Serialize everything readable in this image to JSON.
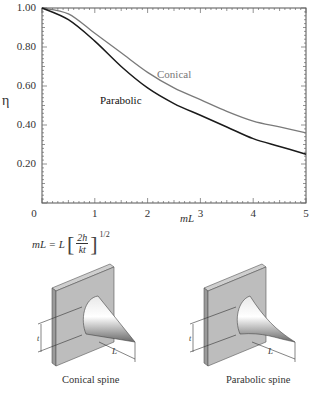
{
  "chart_data": {
    "type": "line",
    "title": "",
    "xlabel": "mL",
    "ylabel": "η",
    "xlim": [
      0,
      5
    ],
    "ylim": [
      0,
      1.0
    ],
    "x_ticks": [
      "0",
      "1",
      "2",
      "3",
      "4",
      "5"
    ],
    "y_ticks": [
      "1.00",
      "0.80",
      "0.60",
      "0.40",
      "0.20"
    ],
    "grid": false,
    "legend": "inline labels",
    "x": [
      0,
      0.5,
      1,
      1.5,
      2,
      2.5,
      3,
      3.5,
      4,
      4.5,
      5
    ],
    "series": [
      {
        "name": "Conical",
        "color": "#7a7a7a",
        "values": [
          1.0,
          0.97,
          0.87,
          0.77,
          0.67,
          0.59,
          0.53,
          0.47,
          0.42,
          0.39,
          0.36
        ]
      },
      {
        "name": "Parabolic",
        "color": "#1a1a1a",
        "values": [
          1.0,
          0.94,
          0.83,
          0.7,
          0.59,
          0.51,
          0.45,
          0.39,
          0.33,
          0.29,
          0.25
        ]
      }
    ],
    "annotations": [
      "Conical",
      "Parabolic",
      "mL = L[2h/kt]^1/2"
    ]
  },
  "labels": {
    "eta": "η",
    "xaxis": "mL",
    "conical": "Conical",
    "parabolic": "Parabolic",
    "formula": {
      "lhs": "mL = L",
      "num": "2h",
      "den": "kt",
      "exp": "1/2"
    }
  },
  "illustrations": [
    {
      "caption": "Conical spine",
      "t": "t",
      "L": "L"
    },
    {
      "caption": "Parabolic spine",
      "t": "t",
      "L": "L"
    }
  ]
}
